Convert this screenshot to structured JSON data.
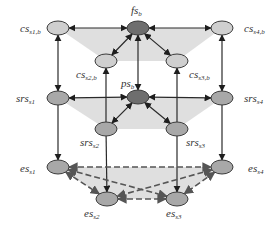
{
  "diagram": {
    "colors": {
      "plane_fill": "#d9d9d9",
      "node_dark": "#6e6e6e",
      "node_medium": "#a8a8a8",
      "node_light": "#cfcfcf",
      "node_stroke": "#3a3a3a",
      "edge_solid": "#2a2a2a",
      "edge_dashed": "#555555"
    },
    "nodes": [
      {
        "id": "cs_s1_b",
        "base": "cs",
        "sub": "s1,b",
        "x": 58,
        "y": 28,
        "tone": "light",
        "label_x": 20,
        "label_y": 32
      },
      {
        "id": "fs_b",
        "base": "fs",
        "sub": "b",
        "x": 138,
        "y": 28,
        "tone": "dark",
        "label_x": 131,
        "label_y": 14
      },
      {
        "id": "cs_s4_b",
        "base": "cs",
        "sub": "s4,b",
        "x": 222,
        "y": 28,
        "tone": "light",
        "label_x": 244,
        "label_y": 32
      },
      {
        "id": "cs_s2_b",
        "base": "cs",
        "sub": "s2,b",
        "x": 106,
        "y": 61,
        "tone": "light",
        "label_x": 76,
        "label_y": 78
      },
      {
        "id": "cs_s3_b",
        "base": "cs",
        "sub": "s3,b",
        "x": 177,
        "y": 61,
        "tone": "light",
        "label_x": 189,
        "label_y": 78
      },
      {
        "id": "ps_b",
        "base": "ps",
        "sub": "b",
        "x": 138,
        "y": 97,
        "tone": "dark",
        "label_x": 121,
        "label_y": 87
      },
      {
        "id": "srs_s1",
        "base": "srs",
        "sub": "s1",
        "x": 58,
        "y": 98,
        "tone": "medium",
        "label_x": 16,
        "label_y": 102
      },
      {
        "id": "srs_s4",
        "base": "srs",
        "sub": "s4",
        "x": 222,
        "y": 98,
        "tone": "medium",
        "label_x": 244,
        "label_y": 102
      },
      {
        "id": "srs_s2",
        "base": "srs",
        "sub": "s2",
        "x": 106,
        "y": 129,
        "tone": "medium",
        "label_x": 80,
        "label_y": 146
      },
      {
        "id": "srs_s3",
        "base": "srs",
        "sub": "s3",
        "x": 177,
        "y": 129,
        "tone": "medium",
        "label_x": 186,
        "label_y": 146
      },
      {
        "id": "es_s1",
        "base": "es",
        "sub": "s1",
        "x": 58,
        "y": 167,
        "tone": "medium",
        "label_x": 20,
        "label_y": 172
      },
      {
        "id": "es_s4",
        "base": "es",
        "sub": "s4",
        "x": 222,
        "y": 167,
        "tone": "medium",
        "label_x": 248,
        "label_y": 172
      },
      {
        "id": "es_s2",
        "base": "es",
        "sub": "s2",
        "x": 107,
        "y": 199,
        "tone": "medium",
        "label_x": 84,
        "label_y": 217
      },
      {
        "id": "es_s3",
        "base": "es",
        "sub": "s3",
        "x": 177,
        "y": 199,
        "tone": "medium",
        "label_x": 166,
        "label_y": 217
      }
    ],
    "edges": [
      {
        "from": "cs_s1_b",
        "to": "fs_b",
        "style": "solid",
        "dir": "both"
      },
      {
        "from": "cs_s4_b",
        "to": "fs_b",
        "style": "solid",
        "dir": "both"
      },
      {
        "from": "cs_s2_b",
        "to": "fs_b",
        "style": "solid",
        "dir": "both"
      },
      {
        "from": "cs_s3_b",
        "to": "fs_b",
        "style": "solid",
        "dir": "both"
      },
      {
        "from": "ps_b",
        "to": "fs_b",
        "style": "solid",
        "dir": "both"
      },
      {
        "from": "cs_s1_b",
        "to": "srs_s1",
        "style": "solid",
        "dir": "both"
      },
      {
        "from": "cs_s4_b",
        "to": "srs_s4",
        "style": "solid",
        "dir": "both"
      },
      {
        "from": "srs_s2",
        "to": "cs_s2_b",
        "style": "solid",
        "dir": "forward"
      },
      {
        "from": "srs_s3",
        "to": "cs_s3_b",
        "style": "solid",
        "dir": "forward"
      },
      {
        "from": "srs_s1",
        "to": "ps_b",
        "style": "solid",
        "dir": "both"
      },
      {
        "from": "srs_s4",
        "to": "ps_b",
        "style": "solid",
        "dir": "both"
      },
      {
        "from": "srs_s2",
        "to": "ps_b",
        "style": "solid",
        "dir": "both"
      },
      {
        "from": "srs_s3",
        "to": "ps_b",
        "style": "solid",
        "dir": "both"
      },
      {
        "from": "srs_s1",
        "to": "es_s1",
        "style": "solid",
        "dir": "forward"
      },
      {
        "from": "srs_s4",
        "to": "es_s4",
        "style": "solid",
        "dir": "forward"
      },
      {
        "from": "srs_s2",
        "to": "es_s2",
        "style": "solid",
        "dir": "forward"
      },
      {
        "from": "srs_s3",
        "to": "es_s3",
        "style": "solid",
        "dir": "forward"
      },
      {
        "from": "es_s1",
        "to": "es_s4",
        "style": "dashed",
        "dir": "both"
      },
      {
        "from": "es_s1",
        "to": "es_s2",
        "style": "dashed",
        "dir": "both"
      },
      {
        "from": "es_s1",
        "to": "es_s3",
        "style": "dashed",
        "dir": "both"
      },
      {
        "from": "es_s4",
        "to": "es_s2",
        "style": "dashed",
        "dir": "both"
      },
      {
        "from": "es_s4",
        "to": "es_s3",
        "style": "dashed",
        "dir": "both"
      },
      {
        "from": "es_s2",
        "to": "es_s3",
        "style": "dashed",
        "dir": "both"
      }
    ],
    "planes": [
      {
        "name": "top-plane",
        "points": "58,28 222,28 177,61 106,61"
      },
      {
        "name": "middle-plane",
        "points": "58,98 222,98 177,129 106,129"
      },
      {
        "name": "bottom-plane",
        "points": "58,167 222,167 177,199 107,199"
      }
    ]
  }
}
